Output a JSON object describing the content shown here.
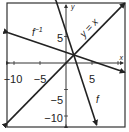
{
  "chart_data": {
    "type": "line",
    "title": "",
    "xlabel": "x",
    "ylabel": "y",
    "xlim": [
      -11.3,
      11.3
    ],
    "ylim": [
      -11.8,
      11.6
    ],
    "grid": false,
    "x_ticks": [
      -10,
      -5,
      5,
      10
    ],
    "y_ticks": [
      5,
      -5,
      -10
    ],
    "x_tick_labels": [
      "−10",
      "−5",
      "5"
    ],
    "y_tick_labels": [
      "5",
      "−5",
      "−10"
    ],
    "series": [
      {
        "name": "y = x",
        "label": "y = x",
        "slope": 1,
        "intercept": 0,
        "x_range": [
          -11.3,
          11.3
        ]
      },
      {
        "name": "f",
        "label": "f",
        "slope": -3,
        "intercept": 6,
        "x_range": [
          -1.9,
          5.9
        ]
      },
      {
        "name": "f^-1",
        "label": "f",
        "label_sup": "−1",
        "slope": -0.3333,
        "intercept": 2,
        "x_range": [
          -11.1,
          11.3
        ]
      }
    ],
    "intersection": [
      1.5,
      1.5
    ]
  }
}
